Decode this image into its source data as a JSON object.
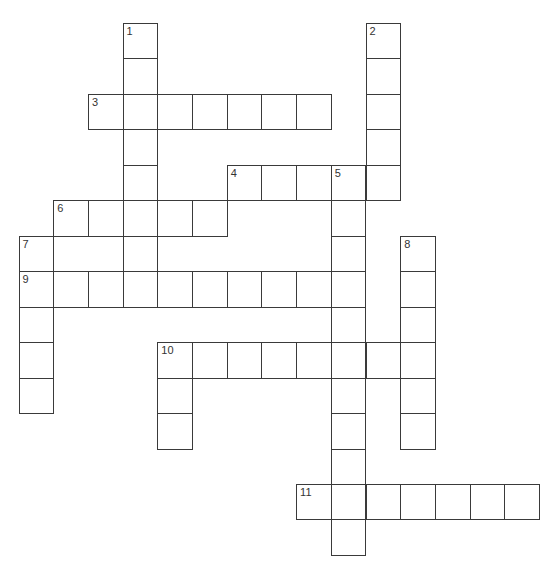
{
  "puzzle": {
    "type": "crossword",
    "grid": {
      "origin_x": 18.5,
      "origin_y": 23,
      "cell_width": 34.7,
      "cell_height": 35.46,
      "columns": 15,
      "rows": 15
    },
    "line_color": "#3a3a3a",
    "entries": [
      {
        "number": "1",
        "direction": "down",
        "row": 0,
        "col": 3,
        "length": 8
      },
      {
        "number": "2",
        "direction": "down",
        "row": 0,
        "col": 10,
        "length": 5
      },
      {
        "number": "3",
        "direction": "across",
        "row": 2,
        "col": 2,
        "length": 7
      },
      {
        "number": "4",
        "direction": "across",
        "row": 4,
        "col": 6,
        "length": 5
      },
      {
        "number": "5",
        "direction": "down",
        "row": 4,
        "col": 9,
        "length": 11
      },
      {
        "number": "6",
        "direction": "across",
        "row": 5,
        "col": 1,
        "length": 5
      },
      {
        "number": "7",
        "direction": "down",
        "row": 6,
        "col": 0,
        "length": 5
      },
      {
        "number": "8",
        "direction": "down",
        "row": 6,
        "col": 11,
        "length": 6
      },
      {
        "number": "9",
        "direction": "across",
        "row": 7,
        "col": 0,
        "length": 10
      },
      {
        "number": "10",
        "direction": "across",
        "row": 9,
        "col": 4,
        "length": 8
      },
      {
        "number": "10d",
        "label": "",
        "direction": "down",
        "row": 9,
        "col": 4,
        "length": 3
      },
      {
        "number": "11",
        "direction": "across",
        "row": 13,
        "col": 8,
        "length": 7
      }
    ]
  }
}
